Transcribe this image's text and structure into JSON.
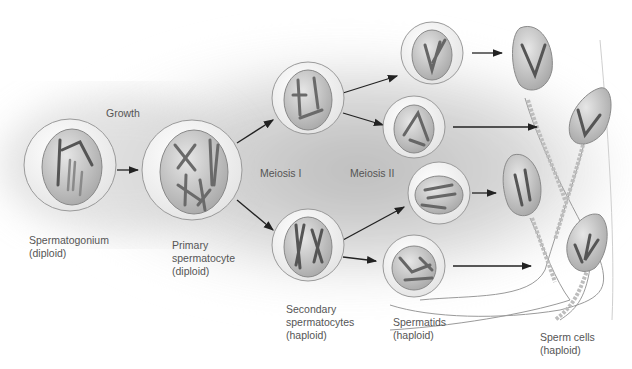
{
  "diagram": {
    "type": "process-flow",
    "colors": {
      "background": "#ffffff",
      "shadow": "#b8b8b8",
      "cell_outer": "#f2f2f2",
      "cell_inner": "#c4c4c4",
      "chromosome": "#6e6e6e",
      "arrow": "#222222",
      "label": "#555555"
    },
    "stage_labels": {
      "growth": "Growth",
      "meiosis_1": "Meiosis I",
      "meiosis_2": "Meiosis II"
    },
    "cells": [
      {
        "id": "spermatogonium",
        "name": "Spermatogonium",
        "ploidy": "(diploid)"
      },
      {
        "id": "primary",
        "name": "Primary\nspermatocyte",
        "ploidy": "(diploid)"
      },
      {
        "id": "secondary",
        "name": "Secondary\nspermatocytes",
        "ploidy": "(haploid)"
      },
      {
        "id": "spermatids",
        "name": "Spermatids",
        "ploidy": "(haploid)"
      },
      {
        "id": "sperm",
        "name": "Sperm cells",
        "ploidy": "(haploid)"
      }
    ],
    "nodes": {
      "spermatogonium": {
        "count": 1
      },
      "primary_spermatocyte": {
        "count": 1
      },
      "secondary_spermatocytes": {
        "count": 2
      },
      "spermatids": {
        "count": 4
      },
      "sperm_cells": {
        "count": 4
      }
    }
  }
}
